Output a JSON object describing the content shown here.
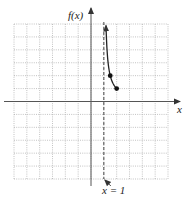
{
  "chart_data": {
    "type": "line",
    "title": "",
    "xlabel": "x",
    "ylabel": "f(x)",
    "xlim": [
      -6,
      6
    ],
    "ylim": [
      -6,
      6
    ],
    "grid": true,
    "grid_step": 1,
    "function": "1/(x-1)",
    "series": [
      {
        "name": "f(x)",
        "x": [
          1.167,
          1.25,
          1.333,
          1.5,
          1.667,
          1.8,
          2
        ],
        "y": [
          6,
          4,
          3,
          2,
          1.5,
          1.25,
          1
        ],
        "end_arrow": "top"
      }
    ],
    "points": [
      {
        "x": 1.5,
        "y": 2,
        "style": "filled"
      },
      {
        "x": 2,
        "y": 1,
        "style": "filled"
      }
    ],
    "asymptotes": [
      {
        "type": "vertical",
        "x": 1,
        "style": "dashed",
        "label": "x = 1"
      }
    ]
  }
}
